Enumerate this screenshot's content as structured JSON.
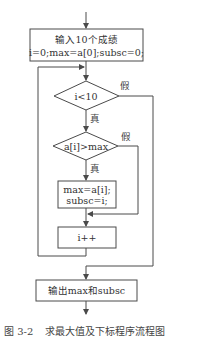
{
  "flowchart": {
    "input_box": {
      "line1": "输入10个成绩",
      "line2": "i=0;max=a[0];subsc=0;"
    },
    "condition_loop": {
      "text": "i<10",
      "true_label": "真",
      "false_label": "假"
    },
    "condition_max": {
      "text": "a[i]>max",
      "true_label": "真",
      "false_label": "假"
    },
    "assign_box": {
      "line1": "max=a[i];",
      "line2": "subsc=i;"
    },
    "increment_box": {
      "text": "i++"
    },
    "output_box": {
      "text": "输出max和subsc"
    }
  },
  "caption": {
    "figure_number": "图 3-2",
    "title": "求最大值及下标程序流程图"
  },
  "colors": {
    "line": "#4a4a4a",
    "text": "#333333",
    "background": "#ffffff"
  }
}
